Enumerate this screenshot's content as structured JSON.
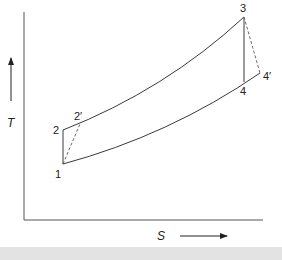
{
  "diagram": {
    "type": "T-S diagram (Brayton cycle, ideal and actual)",
    "axes": {
      "y_label": "T",
      "x_label": "S"
    },
    "points": {
      "p1": "1",
      "p2": "2",
      "p2prime": "2′",
      "p3": "3",
      "p4": "4",
      "p4prime": "4′"
    },
    "processes": [
      {
        "from": "1",
        "to": "2",
        "style": "solid",
        "kind": "isentropic compression"
      },
      {
        "from": "1",
        "to": "2′",
        "style": "dashed",
        "kind": "actual compression"
      },
      {
        "from": "2",
        "to": "3",
        "style": "solid",
        "kind": "constant pressure heat addition"
      },
      {
        "from": "3",
        "to": "4",
        "style": "solid",
        "kind": "isentropic expansion"
      },
      {
        "from": "3",
        "to": "4′",
        "style": "dashed",
        "kind": "actual expansion"
      },
      {
        "from": "1",
        "to": "4′",
        "style": "solid",
        "kind": "constant pressure heat rejection"
      }
    ],
    "colors": {
      "line": "#3a3a3a",
      "dashed": "#6a6a6a",
      "band": "#e3e3e3"
    }
  }
}
